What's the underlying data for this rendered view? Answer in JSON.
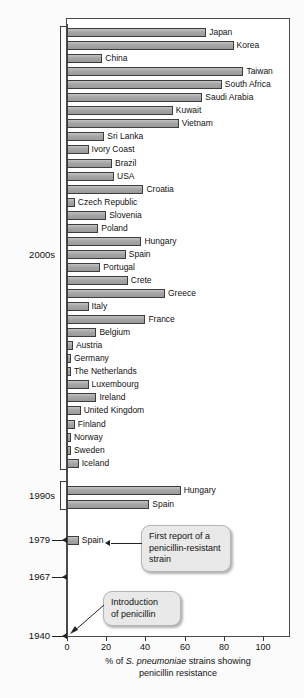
{
  "chart_data": {
    "type": "bar",
    "title": "",
    "orientation": "horizontal",
    "xlabel_line1_pre": "% of ",
    "xlabel_italic": "S. pneumoniae",
    "xlabel_line1_post": " strains showing",
    "xlabel_line2": "penicillin resistance",
    "ylabel": "",
    "xlim": [
      0,
      115
    ],
    "xticks": [
      0,
      20,
      40,
      60,
      80,
      100
    ],
    "xticklabels": [
      "0",
      "20",
      "40",
      "60",
      "80",
      "100"
    ],
    "grid": false,
    "legend": "none",
    "categories": [
      "Japan",
      "Korea",
      "China",
      "Taiwan",
      "South Africa",
      "Saudi Arabia",
      "Kuwait",
      "Vietnam",
      "Sri Lanka",
      "Ivory Coast",
      "Brazil",
      "USA",
      "Croatia",
      "Czech Republic",
      "Slovenia",
      "Poland",
      "Hungary",
      "Spain",
      "Portugal",
      "Crete",
      "Greece",
      "Italy",
      "France",
      "Belgium",
      "Austria",
      "Germany",
      "The Netherlands",
      "Luxembourg",
      "Ireland",
      "United Kingdom",
      "Finland",
      "Norway",
      "Sweden",
      "Iceland",
      "Hungary",
      "Spain",
      "Spain"
    ],
    "values": [
      71,
      85,
      18,
      90,
      79,
      69,
      54,
      57,
      19,
      11,
      23,
      24,
      39,
      4,
      20,
      16,
      38,
      30,
      17,
      31,
      50,
      11,
      40,
      15,
      3,
      2,
      2,
      11,
      15,
      7,
      4,
      2,
      2,
      6,
      58,
      42,
      6
    ],
    "group_labels": [
      "2000s",
      "1990s",
      "1979",
      "1967",
      "1940"
    ],
    "groups": [
      {
        "label": "2000s",
        "count": 34
      },
      {
        "label": "1990s",
        "count": 2
      },
      {
        "label": "1979",
        "count": 1
      },
      {
        "label": "1967",
        "count": 0
      },
      {
        "label": "1940",
        "count": 0
      }
    ],
    "annotations": [
      {
        "name": "first-report",
        "text": "First report of a penicillin-resistant strain",
        "target": "Spain (1979)"
      },
      {
        "name": "introduction",
        "text": "Introduction of penicillin",
        "target": "1940"
      }
    ]
  },
  "axis": {
    "tick_0": "0",
    "tick_20": "20",
    "tick_40": "40",
    "tick_60": "60",
    "tick_80": "80",
    "tick_100": "100",
    "caption_pre": "% of ",
    "caption_italic": "S. pneumoniae",
    "caption_post": " strains showing",
    "caption_line2": "penicillin resistance"
  },
  "year_labels": {
    "y2000s": "2000s",
    "y1990s": "1990s",
    "y1979": "1979",
    "y1967": "1967",
    "y1940": "1940"
  },
  "callouts": {
    "first_report_line1": "First report of a",
    "first_report_line2": "penicillin-resistant",
    "first_report_line3": "strain",
    "introduction_line1": "Introduction",
    "introduction_line2": "of penicillin"
  },
  "bar_labels": {
    "b0": "Japan",
    "b1": "Korea",
    "b2": "China",
    "b3": "Taiwan",
    "b4": "South Africa",
    "b5": "Saudi Arabia",
    "b6": "Kuwait",
    "b7": "Vietnam",
    "b8": "Sri Lanka",
    "b9": "Ivory Coast",
    "b10": "Brazil",
    "b11": "USA",
    "b12": "Croatia",
    "b13": "Czech Republic",
    "b14": "Slovenia",
    "b15": "Poland",
    "b16": "Hungary",
    "b17": "Spain",
    "b18": "Portugal",
    "b19": "Crete",
    "b20": "Greece",
    "b21": "Italy",
    "b22": "France",
    "b23": "Belgium",
    "b24": "Austria",
    "b25": "Germany",
    "b26": "The Netherlands",
    "b27": "Luxembourg",
    "b28": "Ireland",
    "b29": "United Kingdom",
    "b30": "Finland",
    "b31": "Norway",
    "b32": "Sweden",
    "b33": "Iceland",
    "b34": "Hungary",
    "b35": "Spain",
    "b36": "Spain"
  },
  "colors": {
    "bar_fill": "#a8a8a8",
    "bar_stroke": "#3d3d3d",
    "frame": "#4a4a4a",
    "callout_bg": "#e9e9e9",
    "text": "#111111",
    "background": "#fbfbfb"
  }
}
